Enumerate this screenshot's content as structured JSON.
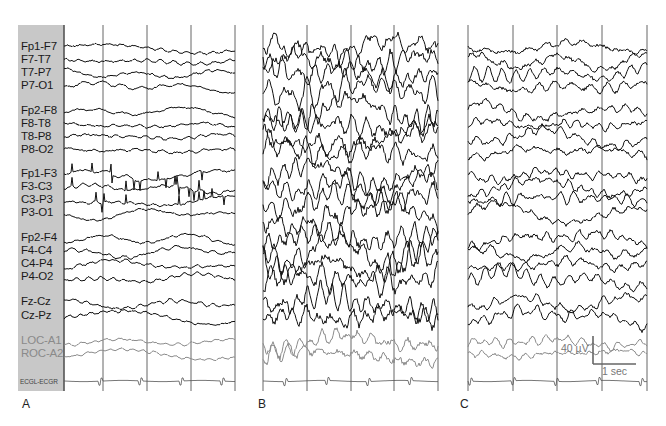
{
  "figure": {
    "panels": [
      {
        "id": "A",
        "letter": "A",
        "letter_x": 22,
        "x0": 64,
        "x1": 235,
        "gridlines": [
          64,
          103,
          147,
          191,
          235
        ],
        "activity": "normal",
        "seed": 11,
        "hf": 0.35,
        "amp": 1.0
      },
      {
        "id": "B",
        "letter": "B",
        "letter_x": 258,
        "x0": 263,
        "x1": 438,
        "gridlines": [
          263,
          307,
          351,
          394,
          438
        ],
        "activity": "high",
        "seed": 29,
        "hf": 1.0,
        "amp": 2.4
      },
      {
        "id": "C",
        "letter": "C",
        "letter_x": 460,
        "x0": 468,
        "x1": 647,
        "gridlines": [
          468,
          513,
          557,
          602,
          647
        ],
        "activity": "moderate",
        "seed": 53,
        "hf": 0.75,
        "amp": 1.4
      }
    ],
    "grid_top": 25,
    "grid_bottom": 391,
    "trace_color": "#111111",
    "eog_color": "#8c8c8c",
    "ecg_color": "#555555",
    "grid_color": "#555555",
    "label_box_color": "#c8c8c8"
  },
  "channels": [
    {
      "name": "Fp1-F7",
      "y": 47,
      "type": "eeg"
    },
    {
      "name": "F7-T7",
      "y": 60,
      "type": "eeg"
    },
    {
      "name": "T7-P7",
      "y": 73,
      "type": "eeg"
    },
    {
      "name": "P7-O1",
      "y": 86,
      "type": "eeg"
    },
    {
      "name": "Fp2-F8",
      "y": 111,
      "type": "eeg"
    },
    {
      "name": "F8-T8",
      "y": 124,
      "type": "eeg"
    },
    {
      "name": "T8-P8",
      "y": 137,
      "type": "eeg"
    },
    {
      "name": "P8-O2",
      "y": 150,
      "type": "eeg"
    },
    {
      "name": "Fp1-F3",
      "y": 174,
      "type": "eeg"
    },
    {
      "name": "F3-C3",
      "y": 187,
      "type": "eeg"
    },
    {
      "name": "C3-P3",
      "y": 200,
      "type": "eeg"
    },
    {
      "name": "P3-O1",
      "y": 213,
      "type": "eeg"
    },
    {
      "name": "Fp2-F4",
      "y": 238,
      "type": "eeg"
    },
    {
      "name": "F4-C4",
      "y": 251,
      "type": "eeg"
    },
    {
      "name": "C4-P4",
      "y": 264,
      "type": "eeg"
    },
    {
      "name": "P4-O2",
      "y": 277,
      "type": "eeg"
    },
    {
      "name": "Fz-Cz",
      "y": 302,
      "type": "eeg"
    },
    {
      "name": "Cz-Pz",
      "y": 316,
      "type": "eeg"
    },
    {
      "name": "LOC-A1",
      "y": 341,
      "type": "eog"
    },
    {
      "name": "ROC-A2",
      "y": 354,
      "type": "eog"
    },
    {
      "name": "ECGL-ECGR",
      "y": 380,
      "type": "ecg"
    }
  ],
  "scale_bar": {
    "voltage_label": "40 µV",
    "time_label": "1 sec",
    "x": 593,
    "y_top": 336,
    "y_bottom": 364,
    "x_end": 636,
    "color": "#666666"
  },
  "chart_data": {
    "type": "line",
    "title": "",
    "panels": [
      "A",
      "B",
      "C"
    ],
    "channels": [
      "Fp1-F7",
      "F7-T7",
      "T7-P7",
      "P7-O1",
      "Fp2-F8",
      "F8-T8",
      "T8-P8",
      "P8-O2",
      "Fp1-F3",
      "F3-C3",
      "C3-P3",
      "P3-O1",
      "Fp2-F4",
      "F4-C4",
      "C4-P4",
      "P4-O2",
      "Fz-Cz",
      "Cz-Pz",
      "LOC-A1",
      "ROC-A2",
      "ECGL-ECGR"
    ],
    "xlabel": "time (1 sec per grid division)",
    "ylabel": "amplitude",
    "scale": {
      "voltage": "40 µV",
      "time": "1 sec"
    },
    "seconds_per_panel": 4,
    "grid": true
  }
}
